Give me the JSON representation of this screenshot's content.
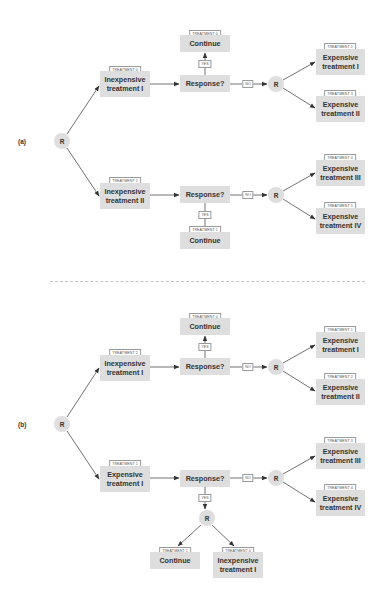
{
  "colors": {
    "node_fill": "#dedede",
    "edge": "#333333",
    "divider": "#c4c4c4",
    "tag_border": "#9a9a9a"
  },
  "panels": [
    {
      "label": "(a)",
      "root": "R",
      "stage1": [
        {
          "tag": "TREATMENT 0",
          "text": "Inexpensive treatment I"
        },
        {
          "tag": "TREATMENT 1",
          "text": "Inexpensive treatment II"
        }
      ],
      "response": [
        "Response?",
        "Response?"
      ],
      "continue": [
        {
          "tag": "TREATMENT 0",
          "text": "Continue"
        },
        {
          "tag": "TREATMENT 1",
          "text": "Continue"
        }
      ],
      "yes": [
        "YES",
        "YES"
      ],
      "no": [
        "NO",
        "NO"
      ],
      "rerandomize": [
        "R",
        "R"
      ],
      "stage2": [
        {
          "tag": "TREATMENT 2",
          "text": "Expensive treatment I"
        },
        {
          "tag": "TREATMENT 3",
          "text": "Expensive treatment II"
        },
        {
          "tag": "TREATMENT 4",
          "text": "Expensive treatment III"
        },
        {
          "tag": "TREATMENT 5",
          "text": "Expensive treatment IV"
        }
      ]
    },
    {
      "label": "(b)",
      "root": "R",
      "stage1": [
        {
          "tag": "TREATMENT 2",
          "text": "Inexpensive treatment I"
        },
        {
          "tag": "TREATMENT 1",
          "text": "Expensive treatment I"
        }
      ],
      "response": [
        "Response?",
        "Response?"
      ],
      "continue": [
        {
          "tag": "TREATMENT 0",
          "text": "Continue"
        },
        {
          "tag": "TREATMENT 1",
          "text": "Continue"
        }
      ],
      "yes": [
        "YES",
        "YES"
      ],
      "no": [
        "NO",
        "NO"
      ],
      "rerandomize": [
        "R",
        "R",
        "R"
      ],
      "yes_branch_extra": {
        "tag": "TREATMENT 0",
        "text": "Inexpensive treatment I"
      },
      "stage2": [
        {
          "tag": "TREATMENT 1",
          "text": "Expensive treatment I"
        },
        {
          "tag": "TREATMENT 2",
          "text": "Expensive treatment II"
        },
        {
          "tag": "TREATMENT 3",
          "text": "Expensive treatment III"
        },
        {
          "tag": "TREATMENT 4",
          "text": "Expensive treatment IV"
        }
      ]
    }
  ]
}
